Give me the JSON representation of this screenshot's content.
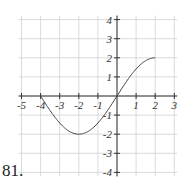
{
  "problem_number": "81.",
  "chart_data": {
    "type": "line",
    "title": "",
    "xlabel": "",
    "ylabel": "",
    "xlim": [
      -5,
      3
    ],
    "ylim": [
      -4,
      4
    ],
    "grid": true,
    "x_ticks": [
      -5,
      -4,
      -3,
      -2,
      -1,
      1,
      2,
      3
    ],
    "y_ticks": [
      -4,
      -3,
      -2,
      -1,
      1,
      2,
      3,
      4
    ],
    "series": [
      {
        "name": "f(x)",
        "description": "smooth curve from (-4,0) down to minimum (-2,-2), up through (0,0) to endpoint (2,2)",
        "key_points": [
          [
            -4,
            0
          ],
          [
            -2,
            -2
          ],
          [
            0,
            0
          ],
          [
            2,
            2
          ]
        ],
        "x": [
          -4,
          -3.5,
          -3,
          -2.5,
          -2,
          -1.5,
          -1,
          -0.5,
          0,
          0.5,
          1,
          1.5,
          2
        ],
        "y": [
          0,
          -0.77,
          -1.41,
          -1.85,
          -2,
          -1.85,
          -1.41,
          -0.77,
          0,
          0.77,
          1.41,
          1.85,
          2
        ]
      }
    ]
  },
  "colors": {
    "grid": "#d0d0d0",
    "axis": "#333333",
    "curve": "#444444",
    "text": "#333333"
  }
}
